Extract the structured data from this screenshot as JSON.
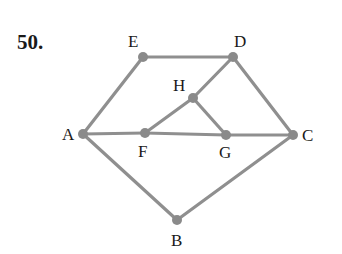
{
  "problem": {
    "number": "50."
  },
  "colors": {
    "edge": "#8f8f8f",
    "node": "#8a8a8a",
    "text": "#1a1a1a"
  },
  "graph": {
    "nodes": [
      {
        "id": "A",
        "label": "A",
        "x": 83,
        "y": 134,
        "lx": 62,
        "ly": 140
      },
      {
        "id": "B",
        "label": "B",
        "x": 177,
        "y": 220,
        "lx": 171,
        "ly": 246
      },
      {
        "id": "C",
        "label": "C",
        "x": 293,
        "y": 135,
        "lx": 302,
        "ly": 141
      },
      {
        "id": "D",
        "label": "D",
        "x": 233,
        "y": 57,
        "lx": 234,
        "ly": 47
      },
      {
        "id": "E",
        "label": "E",
        "x": 143,
        "y": 57,
        "lx": 128,
        "ly": 47
      },
      {
        "id": "F",
        "label": "F",
        "x": 145,
        "y": 133,
        "lx": 138,
        "ly": 157
      },
      {
        "id": "G",
        "label": "G",
        "x": 226,
        "y": 135,
        "lx": 219,
        "ly": 158
      },
      {
        "id": "H",
        "label": "H",
        "x": 193,
        "y": 98,
        "lx": 173,
        "ly": 91
      }
    ],
    "edges": [
      [
        "A",
        "E"
      ],
      [
        "E",
        "D"
      ],
      [
        "D",
        "H"
      ],
      [
        "D",
        "C"
      ],
      [
        "H",
        "F"
      ],
      [
        "H",
        "G"
      ],
      [
        "A",
        "F"
      ],
      [
        "F",
        "G"
      ],
      [
        "G",
        "C"
      ],
      [
        "A",
        "B"
      ],
      [
        "B",
        "C"
      ]
    ]
  }
}
